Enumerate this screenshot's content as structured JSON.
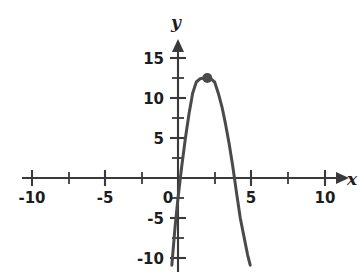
{
  "figure": {
    "background_color": "#ffffff",
    "curve_color": "#4a4a4a",
    "axis_color": "#3a3a3a",
    "label_color": "#1d1d1d"
  },
  "chart_data": {
    "type": "line",
    "title": "",
    "xlabel": "x",
    "ylabel": "y",
    "xlim": [
      -11,
      11
    ],
    "ylim": [
      -11.5,
      16.5
    ],
    "grid": false,
    "legend": null,
    "x_ticks_major": [
      -10,
      -5,
      0,
      5,
      10
    ],
    "x_ticks_minor": [
      -7.5,
      -2.5,
      2.5,
      7.5
    ],
    "x_tick_labels": [
      "-10",
      "-5",
      "0",
      "5",
      "10"
    ],
    "y_ticks_major": [
      -10,
      -5,
      5,
      10,
      15
    ],
    "y_ticks_minor": [
      -7.5,
      -2.5,
      2.5,
      7.5,
      12.5
    ],
    "y_tick_labels": [
      "-10",
      "-5",
      "5",
      "10",
      "15"
    ],
    "series": [
      {
        "name": "parabola",
        "equation": "y = -3x^2 + 12x",
        "vertex": [
          2,
          12.5
        ],
        "roots": [
          0.1,
          4.1
        ],
        "x": [
          -0.42,
          -0.2,
          0.0,
          0.25,
          0.5,
          0.75,
          1.0,
          1.25,
          1.5,
          1.75,
          2.0,
          2.25,
          2.5,
          2.75,
          3.0,
          3.25,
          3.5,
          3.75,
          4.0,
          4.25,
          4.5,
          4.75,
          4.93
        ],
        "values": [
          -10.9,
          -6.1,
          -2.5,
          1.4,
          4.9,
          8.0,
          10.6,
          12.0,
          12.4,
          12.5,
          12.5,
          12.4,
          12.0,
          10.6,
          8.9,
          6.7,
          4.2,
          1.3,
          -1.9,
          -5.0,
          -7.3,
          -9.6,
          -10.9
        ]
      }
    ],
    "markers": [
      {
        "name": "vertex-point",
        "x": 2.0,
        "y": 12.5,
        "style": "filled-circle"
      }
    ]
  },
  "axis_labels": {
    "x_axis_name": "x",
    "y_axis_name": "y"
  }
}
